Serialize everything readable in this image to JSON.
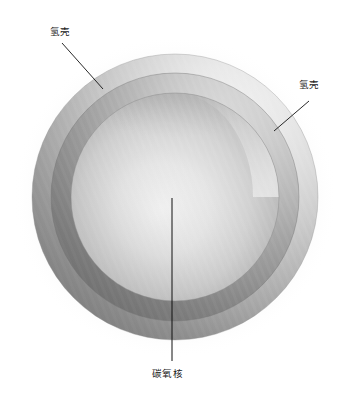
{
  "figure": {
    "domain": "diagram",
    "background_color": "#ffffff"
  },
  "labels": {
    "hydrogen_shell_left": "氢壳",
    "hydrogen_shell_right": "氢壳",
    "carbon_oxygen_core": "碳氧核"
  },
  "leader_lines": [
    {
      "name": "leader-hydrogen-left",
      "from_x": 62,
      "from_y": 43,
      "to_x": 103,
      "to_y": 89,
      "color": "#111111",
      "width": 0.9
    },
    {
      "name": "leader-hydrogen-right",
      "from_x": 309,
      "from_y": 101,
      "to_x": 274,
      "to_y": 131,
      "color": "#111111",
      "width": 0.9
    },
    {
      "name": "leader-co-core",
      "from_x": 172,
      "from_y": 198,
      "to_x": 172,
      "to_y": 361,
      "color": "#111111",
      "width": 1.0
    }
  ],
  "sphere": {
    "center_x": 175,
    "center_y": 197,
    "outer_radius": 143,
    "mid_radius": 124,
    "core_radius": 104,
    "light_direction": "upper-right",
    "halo_radius": 160
  },
  "layers": [
    {
      "name": "hydrogen-shell-outer",
      "label_key": "hydrogen_shell_left",
      "radius": 143,
      "color_light": "#d7d7d7",
      "color_dark": "#9a9a9a"
    },
    {
      "name": "intermediate-shell",
      "radius": 124,
      "color_light": "#bdbdbd",
      "color_dark": "#7d7d7d"
    },
    {
      "name": "carbon-oxygen-core",
      "label_key": "carbon_oxygen_core",
      "radius": 104,
      "color_light": "#ededed",
      "color_dark": "#8c8c8c"
    }
  ],
  "colors": {
    "line": "#111111",
    "text": "#1a1a1a",
    "halo": "#e3e3e3"
  }
}
